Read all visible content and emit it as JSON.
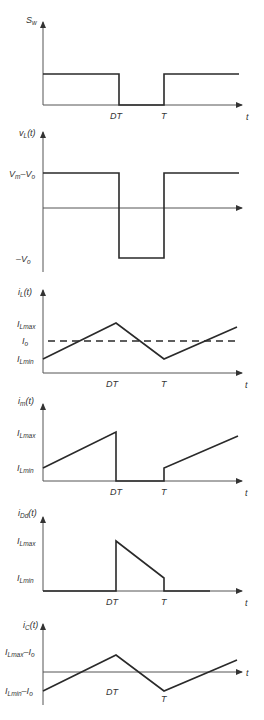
{
  "figure": {
    "common_time_labels": {
      "dt": "DT",
      "t": "T",
      "axis": "t"
    },
    "panels": [
      {
        "id": "switch",
        "ylabel": "S",
        "ylabel_sub": "w",
        "levels": [],
        "time_labels": [
          "DT",
          "T",
          "t"
        ]
      },
      {
        "id": "inductor-voltage",
        "ylabel": "v",
        "ylabel_sub": "L",
        "ylabel_suffix": "(t)",
        "levels": [
          {
            "label": "V",
            "sub": "m",
            "rest": "–V",
            "sub2": "o"
          },
          {
            "label": "–V",
            "sub": "o"
          }
        ],
        "time_labels": []
      },
      {
        "id": "inductor-current",
        "ylabel": "i",
        "ylabel_sub": "L",
        "ylabel_suffix": "(t)",
        "levels": [
          {
            "label": "I",
            "sub": "Lmax"
          },
          {
            "label": "I",
            "sub": "o"
          },
          {
            "label": "I",
            "sub": "Lmin"
          }
        ],
        "time_labels": [
          "DT",
          "T",
          "t"
        ]
      },
      {
        "id": "input-current",
        "ylabel": "i",
        "ylabel_sub": "m",
        "ylabel_suffix": "(t)",
        "levels": [
          {
            "label": "I",
            "sub": "Lmax"
          },
          {
            "label": "I",
            "sub": "Lmin"
          }
        ],
        "time_labels": [
          "DT",
          "T",
          "t"
        ]
      },
      {
        "id": "diode-current",
        "ylabel": "i",
        "ylabel_sub": "Dd",
        "ylabel_suffix": "(t)",
        "levels": [
          {
            "label": "I",
            "sub": "Lmax"
          },
          {
            "label": "I",
            "sub": "Lmin"
          }
        ],
        "time_labels": [
          "DT",
          "T",
          "t"
        ]
      },
      {
        "id": "capacitor-current",
        "ylabel": "i",
        "ylabel_sub": "C",
        "ylabel_suffix": "(t)",
        "levels": [
          {
            "label": "I",
            "sub": "Lmax",
            "rest": "–I",
            "sub2": "o"
          },
          {
            "label": "I",
            "sub": "Lmin",
            "rest": "–I",
            "sub2": "o"
          }
        ],
        "time_labels": [
          "DT",
          "T",
          "t"
        ]
      }
    ]
  }
}
